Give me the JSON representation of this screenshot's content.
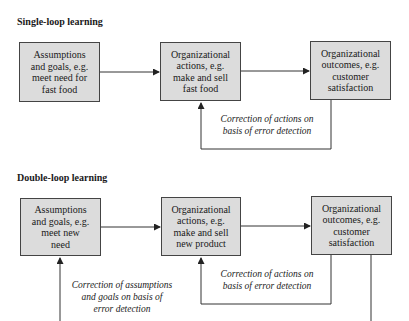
{
  "single_loop": {
    "title": "Single-loop learning",
    "boxes": [
      {
        "label": "Assumptions\nand goals, e.g.\nmeet need for\nfast food"
      },
      {
        "label": "Organizational\nactions, e.g.\nmake and sell\nfast food"
      },
      {
        "label": "Organizational\noutcomes, e.g.\ncustomer\nsatisfaction"
      }
    ],
    "loop_note": "Correction of actions on\nbasis of error detection"
  },
  "double_loop": {
    "title": "Double-loop learning",
    "boxes": [
      {
        "label": "Assumptions\nand goals, e.g.\nmeet new\nneed"
      },
      {
        "label": "Organizational\nactions, e.g.\nmake and sell\nnew product"
      },
      {
        "label": "Organizational\noutcomes, e.g.\ncustomer\nsatisfaction"
      }
    ],
    "inner_loop_note": "Correction of actions on\nbasis of error detection",
    "outer_loop_note": "Correction of assumptions\nand goals  on basis of\nerror detection"
  },
  "colors": {
    "box_fill": "#dcdcdc",
    "line": "#333333"
  }
}
